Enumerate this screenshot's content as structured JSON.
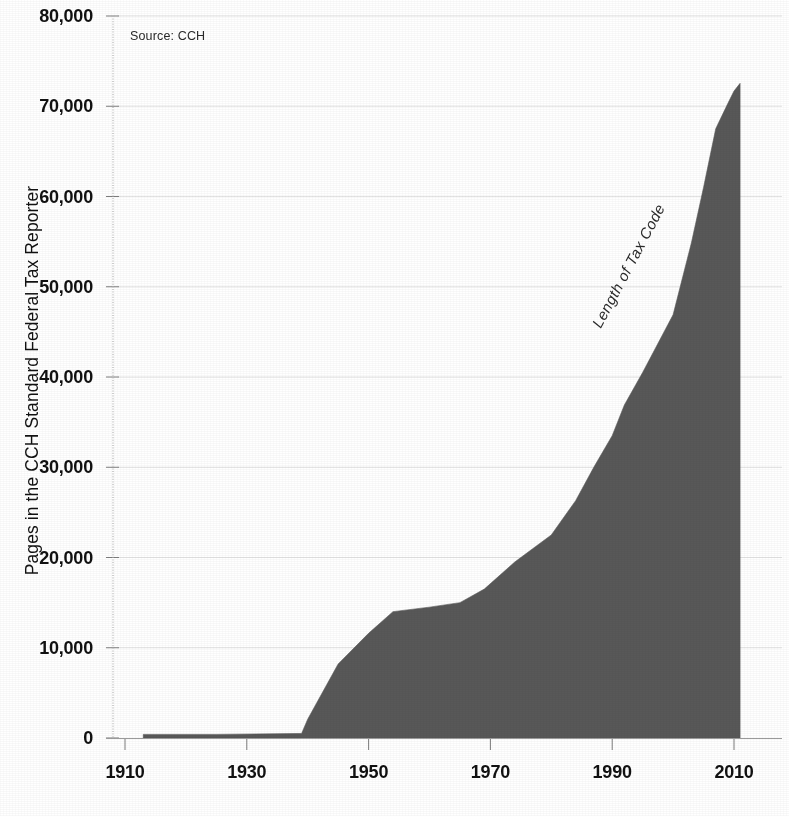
{
  "chart_data": {
    "type": "area",
    "title": "",
    "xlabel": "",
    "ylabel": "Pages in the CCH Standard Federal Tax Reporter",
    "xlim": [
      1910,
      2012
    ],
    "ylim": [
      0,
      80000
    ],
    "grid": true,
    "legend_position": "none",
    "fill_color": "#585858",
    "source_note": "Source: CCH",
    "series_label": "Length of Tax Code",
    "x_ticks": [
      "1910",
      "1930",
      "1950",
      "1970",
      "1990",
      "2010"
    ],
    "x_tick_values": [
      1910,
      1930,
      1950,
      1970,
      1990,
      2010
    ],
    "y_ticks": [
      "0",
      "10,000",
      "20,000",
      "30,000",
      "40,000",
      "50,000",
      "60,000",
      "70,000",
      "80,000"
    ],
    "y_tick_values": [
      0,
      10000,
      20000,
      30000,
      40000,
      50000,
      60000,
      70000,
      80000
    ],
    "x": [
      1913,
      1925,
      1939,
      1940,
      1945,
      1950,
      1954,
      1960,
      1965,
      1969,
      1974,
      1980,
      1984,
      1987,
      1990,
      1992,
      1995,
      2000,
      2003,
      2005,
      2007,
      2009,
      2010,
      2011
    ],
    "values": [
      400,
      400,
      504,
      2080,
      8200,
      11600,
      14000,
      14500,
      15000,
      16500,
      19500,
      22500,
      26300,
      30020,
      33500,
      36900,
      40500,
      46900,
      54846,
      61000,
      67500,
      70320,
      71684,
      72536
    ],
    "series": [
      {
        "name": "Length of Tax Code",
        "values": [
          400,
          400,
          504,
          2080,
          8200,
          11600,
          14000,
          14500,
          15000,
          16500,
          19500,
          22500,
          26300,
          30020,
          33500,
          36900,
          40500,
          46900,
          54846,
          61000,
          67500,
          70320,
          71684,
          72536
        ]
      }
    ]
  }
}
